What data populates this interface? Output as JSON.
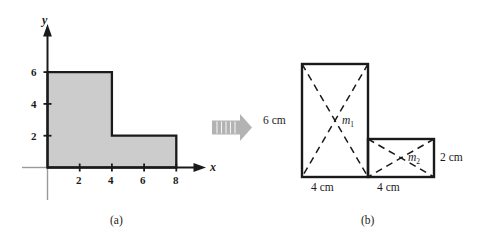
{
  "figure": {
    "panel_a": {
      "caption": "(a)",
      "axes": {
        "x_label": "x",
        "y_label": "y",
        "x_ticks": [
          "2",
          "4",
          "6",
          "8"
        ],
        "y_ticks": [
          "2",
          "4",
          "6"
        ],
        "x_tick_values": [
          2,
          4,
          6,
          8
        ],
        "y_tick_values": [
          2,
          4,
          6
        ]
      },
      "shape": {
        "name": "l-shaped-lamina",
        "fill_color": "#cccccc",
        "stroke_color": "#1a1a1a",
        "vertices": [
          [
            0,
            0
          ],
          [
            0,
            6
          ],
          [
            4,
            6
          ],
          [
            4,
            2
          ],
          [
            8,
            2
          ],
          [
            8,
            0
          ]
        ]
      }
    },
    "arrow": {
      "name": "transform-arrow",
      "direction": "right",
      "color": "#b3b3b3"
    },
    "panel_b": {
      "caption": "(b)",
      "rect1": {
        "mass_label": "m",
        "mass_subscript": "1",
        "height_label": "6 cm",
        "width_label": "4 cm",
        "width_cm": 4,
        "height_cm": 6
      },
      "rect2": {
        "mass_label": "m",
        "mass_subscript": "2",
        "height_label": "2 cm",
        "width_label": "4 cm",
        "width_cm": 4,
        "height_cm": 2
      }
    }
  }
}
